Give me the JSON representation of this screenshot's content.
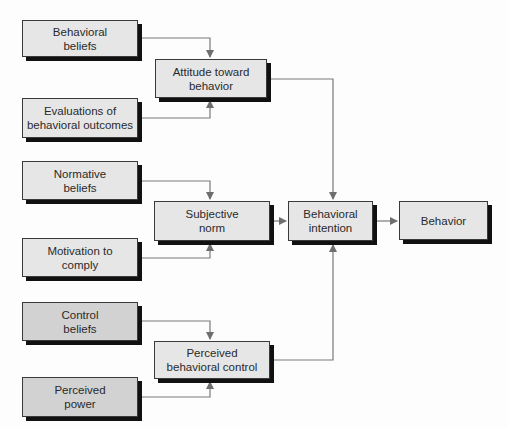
{
  "diagram": {
    "colors": {
      "box_fill": "#e6e6e6",
      "box_fill_dark": "#d2d2d2",
      "box_border": "#3a3a3a",
      "shadow": "#111111",
      "connector": "#7a7a7a"
    },
    "nodes": {
      "behavioral_beliefs": "Behavioral\nbeliefs",
      "evaluations": "Evaluations of\nbehavioral outcomes",
      "attitude": "Attitude toward\nbehavior",
      "normative_beliefs": "Normative\nbeliefs",
      "motivation": "Motivation to\ncomply",
      "subjective_norm": "Subjective\nnorm",
      "control_beliefs": "Control\nbeliefs",
      "perceived_power": "Perceived\npower",
      "pbc": "Perceived\nbehavioral control",
      "intention": "Behavioral\nintention",
      "behavior": "Behavior"
    },
    "edges": [
      {
        "from": "Behavioral beliefs",
        "to": "Attitude toward behavior"
      },
      {
        "from": "Evaluations of behavioral outcomes",
        "to": "Attitude toward behavior"
      },
      {
        "from": "Normative beliefs",
        "to": "Subjective norm"
      },
      {
        "from": "Motivation to comply",
        "to": "Subjective norm"
      },
      {
        "from": "Control beliefs",
        "to": "Perceived behavioral control"
      },
      {
        "from": "Perceived power",
        "to": "Perceived behavioral control"
      },
      {
        "from": "Attitude toward behavior",
        "to": "Behavioral intention"
      },
      {
        "from": "Subjective norm",
        "to": "Behavioral intention"
      },
      {
        "from": "Perceived behavioral control",
        "to": "Behavioral intention"
      },
      {
        "from": "Behavioral intention",
        "to": "Behavior"
      }
    ]
  }
}
